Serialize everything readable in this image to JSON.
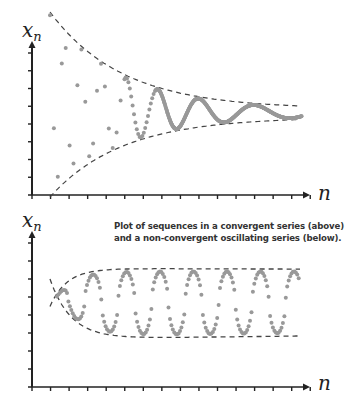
{
  "caption": {
    "line1": "Plot of sequences in a convergent series (above)",
    "line2": "and a non-convergent oscillating series (below)."
  },
  "colors": {
    "axis": "#222222",
    "dots": "#999999",
    "envelope": "#444444",
    "caption": "#333333"
  },
  "chart_data": [
    {
      "type": "scatter",
      "title": "Convergent series",
      "xlabel": "n",
      "ylabel": "x_n",
      "ylabel_main": "x",
      "ylabel_sub": "n",
      "grid": false,
      "legend": null,
      "x_ticks": 15,
      "y_ticks": 7,
      "description": "Damped oscillation of x_n converging to a limit; dashed envelope lines narrow from left to right",
      "limit_fraction": 0.42,
      "initial_amplitude_fraction": 0.48,
      "annotations": [
        "upper dashed envelope",
        "lower dashed envelope"
      ]
    },
    {
      "type": "scatter",
      "title": "Non-convergent oscillating series",
      "xlabel": "n",
      "ylabel": "x_n",
      "ylabel_main": "x",
      "ylabel_sub": "n",
      "grid": false,
      "legend": null,
      "x_ticks": 15,
      "y_ticks": 7,
      "description": "Oscillation of x_n with roughly constant amplitude; dashed envelope lines level off to a fixed band",
      "center_fraction": 0.56,
      "amplitude_fraction": 0.2,
      "annotations": [
        "upper dashed envelope",
        "lower dashed envelope"
      ]
    }
  ]
}
